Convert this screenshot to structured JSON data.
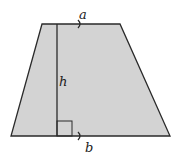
{
  "diagram": {
    "shape": "trapezoid",
    "labels": {
      "top_base": "a",
      "bottom_base": "b",
      "height": "h"
    },
    "vertices": {
      "top_left": [
        42,
        24
      ],
      "top_right": [
        120,
        24
      ],
      "bottom_right": [
        170,
        136
      ],
      "bottom_left": [
        11,
        136
      ]
    },
    "height_line_x": 57,
    "colors": {
      "fill": "#d3d3d3",
      "stroke": "#2a2a2a",
      "background": "#ffffff"
    },
    "markers": [
      "parallel-arrow-top",
      "parallel-arrow-bottom",
      "right-angle"
    ]
  }
}
